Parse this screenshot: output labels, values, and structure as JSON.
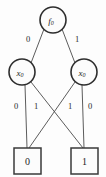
{
  "diagram": {
    "type": "binary-decision-diagram",
    "title": "",
    "colors": {
      "background": "#fdfdfd",
      "node_stroke": "#2e2e2e",
      "edge_stroke": "#4a4a4a",
      "text": "#1c1c1c"
    },
    "nodes": [
      {
        "id": "root",
        "shape": "circle",
        "label": "f",
        "subscript": "0",
        "cx": 53,
        "cy": 20,
        "r": 13
      },
      {
        "id": "left-var",
        "shape": "circle",
        "label": "x",
        "subscript": "0",
        "cx": 22,
        "cy": 72,
        "r": 13
      },
      {
        "id": "right-var",
        "shape": "circle",
        "label": "x",
        "subscript": "0",
        "cx": 84,
        "cy": 72,
        "r": 13
      }
    ],
    "terminals": [
      {
        "id": "terminal-zero",
        "shape": "square",
        "label": "0",
        "x": 14,
        "y": 148,
        "w": 27,
        "h": 26
      },
      {
        "id": "terminal-one",
        "shape": "square",
        "label": "1",
        "x": 71,
        "y": 148,
        "w": 27,
        "h": 26
      }
    ],
    "edges": [
      {
        "id": "root-to-left",
        "from": "root",
        "to": "left-var",
        "label": "0",
        "label_x": 28,
        "label_y": 39,
        "x1": 44,
        "y1": 29,
        "x2": 31,
        "y2": 63
      },
      {
        "id": "root-to-right",
        "from": "root",
        "to": "right-var",
        "label": "1",
        "label_x": 77,
        "label_y": 39,
        "x1": 62,
        "y1": 29,
        "x2": 75,
        "y2": 63
      },
      {
        "id": "left-low",
        "from": "left-var",
        "to": "terminal-zero",
        "label": "0",
        "label_x": 16,
        "label_y": 106,
        "x1": 25,
        "y1": 85,
        "x2": 27,
        "y2": 148
      },
      {
        "id": "left-high",
        "from": "left-var",
        "to": "terminal-one",
        "label": "1",
        "label_x": 36,
        "label_y": 106,
        "x1": 31,
        "y1": 82,
        "x2": 83,
        "y2": 148
      },
      {
        "id": "right-high",
        "from": "right-var",
        "to": "terminal-zero",
        "label": "1",
        "label_x": 70,
        "label_y": 106,
        "x1": 75,
        "y1": 82,
        "x2": 29,
        "y2": 148
      },
      {
        "id": "right-low",
        "from": "right-var",
        "to": "terminal-one",
        "label": "0",
        "label_x": 90,
        "label_y": 106,
        "x1": 82,
        "y1": 85,
        "x2": 84,
        "y2": 148
      }
    ]
  }
}
